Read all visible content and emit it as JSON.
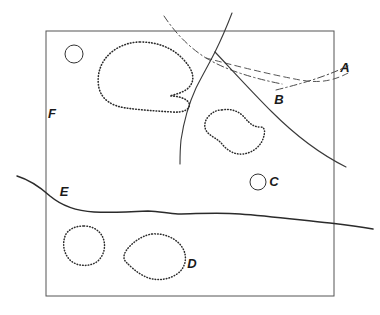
{
  "figure": {
    "type": "geological-sketch-map",
    "background_color": "#ffffff",
    "ink_color": "#1a1a1a",
    "frame": {
      "name": "map-frame",
      "x": 46,
      "y": 31,
      "width": 288,
      "height": 265,
      "stroke": "#555555",
      "stroke_width": 1
    },
    "labels": [
      {
        "id": "A",
        "text": "A",
        "x": 345,
        "y": 72
      },
      {
        "id": "B",
        "text": "B",
        "x": 279,
        "y": 104
      },
      {
        "id": "C",
        "text": "C",
        "x": 274,
        "y": 186
      },
      {
        "id": "D",
        "text": "D",
        "x": 192,
        "y": 268
      },
      {
        "id": "E",
        "text": "E",
        "x": 64,
        "y": 196
      },
      {
        "id": "F",
        "text": "F",
        "x": 52,
        "y": 118
      }
    ],
    "circles": [
      {
        "id": "circle-upper-left",
        "cx": 74,
        "cy": 54,
        "r": 9,
        "stroke": "#333333"
      },
      {
        "id": "circle-c",
        "cx": 258,
        "cy": 182,
        "r": 8,
        "stroke": "#333333"
      }
    ],
    "dotted_outlines": [
      {
        "id": "outline-large-upper",
        "label": "large upper-left dotted body"
      },
      {
        "id": "outline-middle",
        "label": "middle kidney-shaped dotted body"
      },
      {
        "id": "outline-lower-left",
        "label": "small lower-left dotted body"
      },
      {
        "id": "outline-lower-d",
        "label": "lower dotted body D"
      }
    ],
    "lines": [
      {
        "id": "solid-line-main",
        "style": "solid",
        "label": "main solid lineament from top edge to junction"
      },
      {
        "id": "solid-line-branch-left",
        "style": "solid",
        "label": "solid branch descending to lower left"
      },
      {
        "id": "solid-line-branch-right",
        "style": "solid",
        "label": "solid branch descending to right edge past B"
      },
      {
        "id": "dash-dot-line-upper",
        "style": "dash-dot",
        "label": "dash-dot line from top edge trending southeast"
      },
      {
        "id": "dashed-line-a",
        "style": "dashed",
        "label": "dashed line trending east to label A"
      },
      {
        "id": "dash-dot-line-a",
        "style": "dash-dot",
        "label": "dash-dot line trending east-northeast to label A"
      },
      {
        "id": "solid-wavy-line-e",
        "style": "solid",
        "label": "solid wavy boundary line E crossing the map"
      }
    ]
  }
}
